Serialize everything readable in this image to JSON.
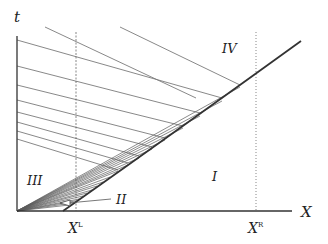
{
  "diagram": {
    "axes": {
      "vertical_label": "t",
      "horizontal_label": "X"
    },
    "markers": [
      {
        "label": "X",
        "superscript": "L",
        "style": "dashed"
      },
      {
        "label": "X",
        "superscript": "R",
        "style": "dotted"
      }
    ],
    "regions": {
      "r1": "I",
      "r2": "II",
      "r3": "III",
      "r4": "IV"
    },
    "colors": {
      "line": "#7a7a7a",
      "axis": "#333333",
      "curve": "#333333",
      "background": "#ffffff"
    }
  }
}
